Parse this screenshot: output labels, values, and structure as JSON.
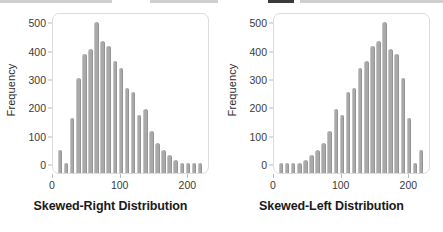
{
  "figure": {
    "background_color": "#ffffff",
    "bar_color": "#a9a9a9",
    "frame_color": "#dcdcdc",
    "text_color": "#1a1a1a"
  },
  "chart_data": [
    {
      "type": "bar",
      "title": "Skewed-Right Distribution",
      "xlabel": "",
      "ylabel": "Frequency",
      "ylim": [
        0,
        530
      ],
      "xlim": [
        0,
        232
      ],
      "grid": false,
      "legend": null,
      "yticks": [
        0,
        100,
        200,
        300,
        400,
        500
      ],
      "ytick_labels": [
        "0",
        "100",
        "200",
        "300",
        "400",
        "500"
      ],
      "xticks": [
        0,
        100,
        200
      ],
      "xtick_labels": [
        "0",
        "100",
        "200"
      ],
      "bin_width": 9,
      "x": [
        10,
        19,
        28,
        37,
        46,
        55,
        64,
        73,
        82,
        91,
        100,
        109,
        118,
        127,
        136,
        145,
        154,
        163,
        172,
        181,
        190,
        199,
        208,
        217
      ],
      "values": [
        58,
        10,
        168,
        310,
        395,
        415,
        510,
        440,
        425,
        370,
        345,
        275,
        260,
        180,
        200,
        122,
        82,
        55,
        40,
        22,
        12,
        10,
        9,
        9
      ]
    },
    {
      "type": "bar",
      "title": "Skewed-Left Distribution",
      "xlabel": "",
      "ylabel": "Frequency",
      "ylim": [
        0,
        530
      ],
      "xlim": [
        0,
        232
      ],
      "grid": false,
      "legend": null,
      "yticks": [
        0,
        100,
        200,
        300,
        400,
        500
      ],
      "ytick_labels": [
        "0",
        "100",
        "200",
        "300",
        "400",
        "500"
      ],
      "xticks": [
        0,
        100,
        200
      ],
      "xtick_labels": [
        "0",
        "100",
        "200"
      ],
      "bin_width": 9,
      "x": [
        10,
        19,
        28,
        37,
        46,
        55,
        64,
        73,
        82,
        91,
        100,
        109,
        118,
        127,
        136,
        145,
        154,
        163,
        172,
        181,
        190,
        199,
        208,
        217
      ],
      "values": [
        9,
        9,
        10,
        12,
        22,
        40,
        55,
        82,
        122,
        200,
        180,
        260,
        275,
        345,
        370,
        425,
        440,
        510,
        415,
        395,
        310,
        168,
        10,
        58
      ]
    }
  ]
}
